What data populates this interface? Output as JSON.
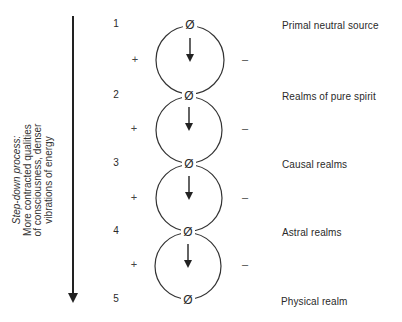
{
  "diagram": {
    "side_arrow": {
      "direction": "down",
      "title": "Step-down process:",
      "lines": [
        "More contracted qualities",
        "of consciousness, denser",
        "vibrations of energy"
      ]
    },
    "nodes": [
      {
        "number": "1",
        "symbol": "Ø",
        "label": "Primal neutral source"
      },
      {
        "number": "2",
        "symbol": "Ø",
        "label": "Realms of pure spirit"
      },
      {
        "number": "3",
        "symbol": "Ø",
        "label": "Causal realms"
      },
      {
        "number": "4",
        "symbol": "Ø",
        "label": "Astral realms"
      },
      {
        "number": "5",
        "symbol": "Ø",
        "label": "Physical realm"
      }
    ],
    "circles": [
      {
        "left_sign": "+",
        "right_sign": "–"
      },
      {
        "left_sign": "+",
        "right_sign": "–"
      },
      {
        "left_sign": "+",
        "right_sign": "–"
      },
      {
        "left_sign": "+",
        "right_sign": "–"
      }
    ],
    "colors": {
      "ink": "#2a2a2a",
      "background": "#ffffff"
    }
  }
}
